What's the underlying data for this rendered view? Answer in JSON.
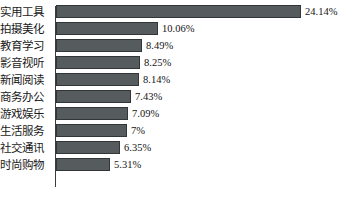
{
  "chart_data": {
    "type": "bar",
    "orientation": "horizontal",
    "title": "",
    "subtitle": "",
    "xlabel": "",
    "ylabel": "",
    "grid": false,
    "legend": null,
    "axis_line": true,
    "xlim": [
      0,
      24.14
    ],
    "bar_color": "#565b5d",
    "bar_edge_color": "#333639",
    "background_color": "#ffffff",
    "value_suffix": "%",
    "categories": [
      "实用工具",
      "拍摄美化",
      "教育学习",
      "影音视听",
      "新闻阅读",
      "商务办公",
      "游戏娱乐",
      "生活服务",
      "社交通讯",
      "时尚购物"
    ],
    "values": [
      24.14,
      10.06,
      8.49,
      8.25,
      8.14,
      7.43,
      7.09,
      7,
      6.35,
      5.31
    ],
    "value_labels": [
      "24.14%",
      "10.06%",
      "8.49%",
      "8.25%",
      "8.14%",
      "7.43%",
      "7.09%",
      "7%",
      "6.35%",
      "5.31%"
    ]
  }
}
